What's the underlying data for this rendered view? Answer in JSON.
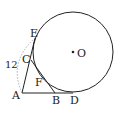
{
  "figure": {
    "type": "geometry",
    "colors": {
      "stroke": "#222222",
      "dashed": "#999999",
      "label": "#222222"
    },
    "circle": {
      "center_label": "O",
      "cx": 73,
      "cy": 52,
      "r": 40
    },
    "points": {
      "A": {
        "label": "A",
        "x": 22,
        "y": 93
      },
      "B": {
        "label": "B",
        "x": 55,
        "y": 93
      },
      "C": {
        "label": "C",
        "x": 31,
        "y": 60
      },
      "D": {
        "label": "D",
        "x": 73,
        "y": 93
      },
      "E": {
        "label": "E",
        "x": 35,
        "y": 38
      },
      "F": {
        "label": "F",
        "x": 42,
        "y": 77
      }
    },
    "measure_label": "12"
  }
}
